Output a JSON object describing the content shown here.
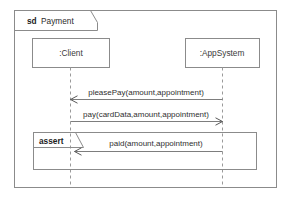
{
  "diagram": {
    "type": "uml-sequence-diagram",
    "frame": {
      "keyword": "sd",
      "name": "Payment"
    },
    "lifelines": [
      {
        "id": "client",
        "label": ":Client"
      },
      {
        "id": "appsystem",
        "label": ":AppSystem"
      }
    ],
    "messages": [
      {
        "id": "m1",
        "label": "pleasePay(amount,appointment)",
        "from": "appsystem",
        "to": "client",
        "direction": "right-to-left"
      },
      {
        "id": "m2",
        "label": "pay(cardData,amount,appointment)",
        "from": "client",
        "to": "appsystem",
        "direction": "left-to-right"
      },
      {
        "id": "m3",
        "label": "paid(amount,appointment)",
        "from": "appsystem",
        "to": "client",
        "direction": "right-to-left"
      }
    ],
    "fragments": [
      {
        "id": "assert-fragment",
        "operator": "assert"
      }
    ],
    "colors": {
      "line": "#8b8b8b",
      "text": "#2d2d2d",
      "background": "#ffffff",
      "lifeline": "#9a9a9a"
    }
  }
}
